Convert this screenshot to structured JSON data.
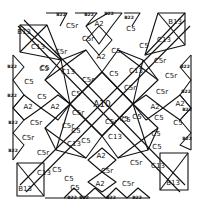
{
  "diagram": {
    "type": "quilt-block-template",
    "center_label": "A10",
    "labels": [
      {
        "t": "B13",
        "x": 24,
        "y": 32,
        "c": "s"
      },
      {
        "t": "C13",
        "x": 38,
        "y": 47,
        "c": "s"
      },
      {
        "t": "C5r",
        "x": 61,
        "y": 52,
        "c": "s"
      },
      {
        "t": "C5",
        "x": 45,
        "y": 68,
        "c": "s"
      },
      {
        "t": "C13",
        "x": 68,
        "y": 72,
        "c": "s"
      },
      {
        "t": "C5r",
        "x": 88,
        "y": 80,
        "c": "s"
      },
      {
        "t": "C5",
        "x": 76,
        "y": 94,
        "c": "s"
      },
      {
        "t": "B22",
        "x": 61,
        "y": 15,
        "c": "xs"
      },
      {
        "t": "C5r",
        "x": 72,
        "y": 26,
        "c": "s"
      },
      {
        "t": "C5r",
        "x": 88,
        "y": 39,
        "c": "s"
      },
      {
        "t": "B22",
        "x": 89,
        "y": 15,
        "c": "xs"
      },
      {
        "t": "A2",
        "x": 99,
        "y": 24,
        "c": "s"
      },
      {
        "t": "B22",
        "x": 109,
        "y": 14,
        "c": "xs"
      },
      {
        "t": "A2",
        "x": 101,
        "y": 57,
        "c": "s"
      },
      {
        "t": "C5",
        "x": 116,
        "y": 51,
        "c": "s"
      },
      {
        "t": "B22",
        "x": 129,
        "y": 18,
        "c": "xs"
      },
      {
        "t": "C5",
        "x": 131,
        "y": 29,
        "c": "s"
      },
      {
        "t": "C5",
        "x": 144,
        "y": 46,
        "c": "s"
      },
      {
        "t": "B13",
        "x": 175,
        "y": 22,
        "c": "s"
      },
      {
        "t": "C13",
        "x": 164,
        "y": 40,
        "c": "s"
      },
      {
        "t": "C5r",
        "x": 160,
        "y": 61,
        "c": "s"
      },
      {
        "t": "C5",
        "x": 114,
        "y": 74,
        "c": "s"
      },
      {
        "t": "C13",
        "x": 136,
        "y": 71,
        "c": "s"
      },
      {
        "t": "C5r",
        "x": 130,
        "y": 88,
        "c": "s"
      },
      {
        "t": "B22",
        "x": 185,
        "y": 67,
        "c": "xs"
      },
      {
        "t": "C5r",
        "x": 171,
        "y": 76,
        "c": "s"
      },
      {
        "t": "C5r",
        "x": 162,
        "y": 92,
        "c": "s"
      },
      {
        "t": "B22",
        "x": 186,
        "y": 92,
        "c": "xs"
      },
      {
        "t": "A2",
        "x": 155,
        "y": 107,
        "c": "s"
      },
      {
        "t": "A2",
        "x": 180,
        "y": 104,
        "c": "s"
      },
      {
        "t": "B22",
        "x": 187,
        "y": 110,
        "c": "xs"
      },
      {
        "t": "C5",
        "x": 159,
        "y": 118,
        "c": "s"
      },
      {
        "t": "C5",
        "x": 178,
        "y": 123,
        "c": "s"
      },
      {
        "t": "B22",
        "x": 187,
        "y": 139,
        "c": "xs"
      },
      {
        "t": "C5",
        "x": 157,
        "y": 147,
        "c": "s"
      },
      {
        "t": "B22",
        "x": 12,
        "y": 67,
        "c": "xs"
      },
      {
        "t": "C5",
        "x": 44,
        "y": 69,
        "c": "s"
      },
      {
        "t": "C5",
        "x": 29,
        "y": 82,
        "c": "s"
      },
      {
        "t": "B22",
        "x": 12,
        "y": 96,
        "c": "xs"
      },
      {
        "t": "C5",
        "x": 42,
        "y": 97,
        "c": "s"
      },
      {
        "t": "A2",
        "x": 28,
        "y": 107,
        "c": "s"
      },
      {
        "t": "A2",
        "x": 55,
        "y": 107,
        "c": "s"
      },
      {
        "t": "B22",
        "x": 13,
        "y": 123,
        "c": "xs"
      },
      {
        "t": "C5r",
        "x": 36,
        "y": 123,
        "c": "s"
      },
      {
        "t": "C5r",
        "x": 28,
        "y": 138,
        "c": "s"
      },
      {
        "t": "B22",
        "x": 13,
        "y": 151,
        "c": "xs"
      },
      {
        "t": "C5r",
        "x": 43,
        "y": 153,
        "c": "s"
      },
      {
        "t": "C5r",
        "x": 68,
        "y": 126,
        "c": "s"
      },
      {
        "t": "C13",
        "x": 74,
        "y": 144,
        "c": "s"
      },
      {
        "t": "C5",
        "x": 86,
        "y": 141,
        "c": "s"
      },
      {
        "t": "C5r",
        "x": 78,
        "y": 113,
        "c": "s"
      },
      {
        "t": "C5",
        "x": 76,
        "y": 131,
        "c": "s"
      },
      {
        "t": "C13",
        "x": 44,
        "y": 173,
        "c": "s"
      },
      {
        "t": "C5",
        "x": 57,
        "y": 170,
        "c": "s"
      },
      {
        "t": "B13",
        "x": 25,
        "y": 189,
        "c": "s"
      },
      {
        "t": "C5",
        "x": 69,
        "y": 179,
        "c": "s"
      },
      {
        "t": "C5",
        "x": 75,
        "y": 188,
        "c": "s"
      },
      {
        "t": "A2",
        "x": 101,
        "y": 156,
        "c": "s"
      },
      {
        "t": "C5r",
        "x": 107,
        "y": 171,
        "c": "s"
      },
      {
        "t": "A2",
        "x": 100,
        "y": 184,
        "c": "s"
      },
      {
        "t": "B22",
        "x": 72,
        "y": 198,
        "c": "xs"
      },
      {
        "t": "B22",
        "x": 84,
        "y": 198,
        "c": "xs"
      },
      {
        "t": "B22",
        "x": 111,
        "y": 198,
        "c": "xs"
      },
      {
        "t": "B22",
        "x": 137,
        "y": 198,
        "c": "xs"
      },
      {
        "t": "C5r",
        "x": 128,
        "y": 184,
        "c": "s"
      },
      {
        "t": "C13",
        "x": 115,
        "y": 137,
        "c": "s"
      },
      {
        "t": "C5",
        "x": 126,
        "y": 120,
        "c": "s"
      },
      {
        "t": "C5",
        "x": 124,
        "y": 119,
        "c": "s"
      },
      {
        "t": "C5r",
        "x": 111,
        "y": 122,
        "c": "s"
      },
      {
        "t": "C13",
        "x": 158,
        "y": 166,
        "c": "s"
      },
      {
        "t": "C5r",
        "x": 136,
        "y": 163,
        "c": "s"
      },
      {
        "t": "B13",
        "x": 173,
        "y": 183,
        "c": "s"
      },
      {
        "t": "C5",
        "x": 137,
        "y": 117,
        "c": "s"
      },
      {
        "t": "C5",
        "x": 156,
        "y": 134,
        "c": "s"
      }
    ]
  }
}
